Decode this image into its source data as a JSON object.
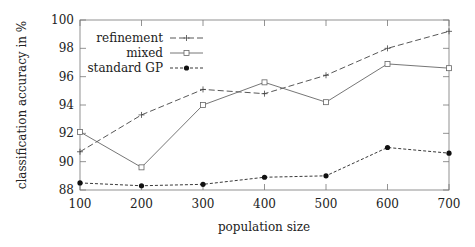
{
  "chart_data": {
    "type": "line",
    "title": "",
    "xlabel": "population size",
    "ylabel": "classification accuracy in %",
    "x": [
      100,
      200,
      300,
      400,
      500,
      600,
      700
    ],
    "xlim": [
      100,
      700
    ],
    "ylim": [
      88,
      100
    ],
    "xticks": [
      "100",
      "200",
      "300",
      "400",
      "500",
      "600",
      "700"
    ],
    "yticks": [
      "88",
      "90",
      "92",
      "94",
      "96",
      "98",
      "100"
    ],
    "grid": false,
    "legend_position": "upper left",
    "series": [
      {
        "name": "refinement",
        "style": "dashed",
        "marker": "plus",
        "color": "#444444",
        "values": [
          90.7,
          93.3,
          95.1,
          94.8,
          96.1,
          98.0,
          99.2
        ]
      },
      {
        "name": "mixed",
        "style": "solid",
        "marker": "square-open",
        "color": "#666666",
        "values": [
          92.1,
          89.6,
          94.0,
          95.6,
          94.2,
          96.9,
          96.6
        ]
      },
      {
        "name": "standard GP",
        "style": "dotted",
        "marker": "circle-filled",
        "color": "#222222",
        "values": [
          88.5,
          88.3,
          88.4,
          88.9,
          89.0,
          91.0,
          90.6
        ]
      }
    ]
  }
}
